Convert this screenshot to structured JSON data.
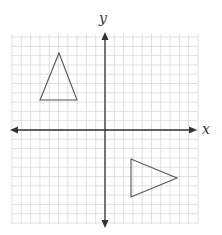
{
  "diagram": {
    "type": "coordinate-plane",
    "axes": {
      "x_label": "x",
      "y_label": "y",
      "origin_px": [
        105,
        130
      ],
      "grid_spacing_px": 9.3,
      "grid_extent_px": {
        "left": 12,
        "right": 198,
        "top": 34,
        "bottom": 224
      }
    },
    "colors": {
      "grid": "#d8d8d8",
      "axis": "#333333",
      "shape_stroke": "#555555"
    },
    "shapes": [
      {
        "name": "triangle-upper-left",
        "points": [
          [
            59,
            53
          ],
          [
            40,
            100
          ],
          [
            77,
            100
          ]
        ]
      },
      {
        "name": "triangle-lower-right",
        "points": [
          [
            131,
            159
          ],
          [
            131,
            197
          ],
          [
            177,
            178
          ]
        ]
      }
    ]
  }
}
